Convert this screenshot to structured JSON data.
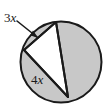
{
  "figure": {
    "kind": "geometry-diagram",
    "background_color": "#ffffff",
    "stroke_color": "#1a1a1a",
    "shaded_fill_color": "#c8c8c8",
    "unshaded_fill_color": "#ffffff",
    "circle": {
      "center_x": 61,
      "center_y": 62,
      "radius": 41
    },
    "vertices": {
      "top": {
        "x": 56,
        "y": 22
      },
      "left": {
        "x": 24,
        "y": 50
      },
      "bottom": {
        "x": 68,
        "y": 97
      }
    },
    "labels": [
      {
        "id": "arc-label-3x",
        "coefficient": "3",
        "variable": "x",
        "text": "3x",
        "x": 4,
        "y": 22,
        "points_to": "thin shaded arc segment between the left vertex and the top vertex"
      },
      {
        "id": "arc-label-4x",
        "coefficient": "4",
        "variable": "x",
        "text": "4x",
        "x": 31,
        "y": 84,
        "points_to": "shaded arc segment between the left vertex and the bottom vertex"
      }
    ],
    "leader_arrow": {
      "id": "leader-arrow-3x",
      "from_x": 17,
      "from_y": 21,
      "to_x": 37,
      "to_y": 37
    }
  }
}
